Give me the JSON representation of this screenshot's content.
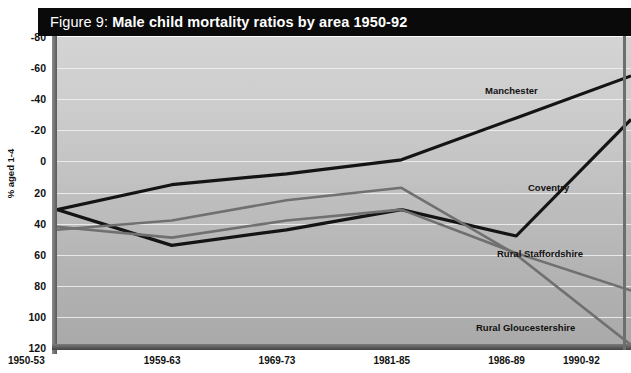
{
  "figure": {
    "title_prefix": "Figure 9:",
    "title_main": "Male child mortality ratios by area 1950-92"
  },
  "chart_data": {
    "type": "line",
    "title": "Figure 9: Male child mortality ratios by area 1950-92",
    "xlabel": "",
    "ylabel": "% aged 1-4",
    "categories": [
      "1950-53",
      "1959-63",
      "1969-73",
      "1981-85",
      "1986-89",
      "1990-92"
    ],
    "ylim": [
      -80,
      120
    ],
    "yticks": [
      -80,
      -60,
      -40,
      -20,
      0,
      20,
      40,
      60,
      80,
      100,
      120
    ],
    "grid": true,
    "legend_position": "inline-labels",
    "series": [
      {
        "name": "Manchester",
        "values": [
          9,
          25,
          32,
          41,
          68,
          95
        ],
        "color": "#141414",
        "width": 3.2
      },
      {
        "name": "Coventry",
        "values": [
          9,
          -14,
          -4,
          9,
          -8,
          67
        ],
        "color": "#141414",
        "width": 3.2
      },
      {
        "name": "Rural Staffordshire",
        "values": [
          -2,
          -9,
          2,
          9,
          -19,
          -43
        ],
        "color": "#707070",
        "width": 2.6
      },
      {
        "name": "Rural Gloucestershire",
        "values": [
          -4,
          2,
          15,
          23,
          -20,
          -78
        ],
        "color": "#707070",
        "width": 2.6
      }
    ]
  },
  "axis": {
    "y_tick_labels": [
      "120",
      "100",
      "80",
      "60",
      "40",
      "20",
      "0",
      "-20",
      "-40",
      "-60",
      "-80"
    ],
    "y_axis_title": "% aged 1-4",
    "x_tick_labels": [
      "1950-53",
      "1959-63",
      "1969-73",
      "1981-85",
      "1986-89",
      "1990-92"
    ]
  },
  "series_labels": [
    {
      "name": "Manchester",
      "x": 485,
      "y": 85
    },
    {
      "name": "Coventry",
      "x": 528,
      "y": 182
    },
    {
      "name": "Rural Staffordshire",
      "x": 497,
      "y": 248
    },
    {
      "name": "Rural Gloucestershire",
      "x": 476,
      "y": 322
    }
  ],
  "colors": {
    "title_bar_bg": "#0a0a0a",
    "title_text": "#ffffff",
    "plot_bg": "#c3c3c3",
    "gridline": "#f2f2f2",
    "dark_series": "#141414",
    "grey_series": "#707070"
  }
}
